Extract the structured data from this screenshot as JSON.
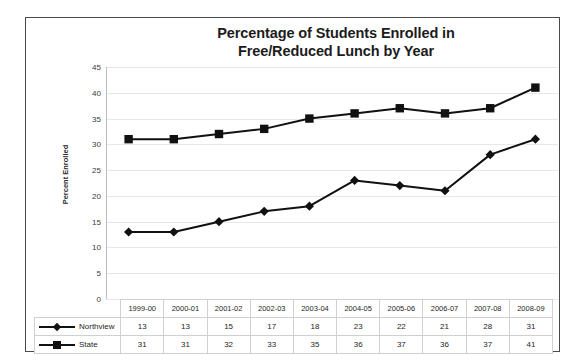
{
  "chart_data": {
    "type": "line",
    "title": "Percentage of Students Enrolled in Free/Reduced Lunch by Year",
    "title_lines": [
      "Percentage of Students Enrolled in",
      "Free/Reduced Lunch by Year"
    ],
    "xlabel": "",
    "ylabel": "Percent Enrolled",
    "ylim": [
      0,
      45
    ],
    "ytick_step": 5,
    "yticks": [
      45,
      40,
      35,
      30,
      25,
      20,
      15,
      10,
      5,
      0
    ],
    "categories": [
      "1999-00",
      "2000-01",
      "2001-02",
      "2002-03",
      "2003-04",
      "2004-05",
      "2005-06",
      "2006-07",
      "2007-08",
      "2008-09"
    ],
    "series": [
      {
        "name": "Northview",
        "marker": "diamond",
        "color": "#111111",
        "values": [
          13,
          13,
          15,
          17,
          18,
          23,
          22,
          21,
          28,
          31
        ]
      },
      {
        "name": "State",
        "marker": "square",
        "color": "#111111",
        "values": [
          31,
          31,
          32,
          33,
          35,
          36,
          37,
          36,
          37,
          41
        ]
      }
    ],
    "grid": true,
    "legend_position": "data-table-left",
    "has_data_table": true
  },
  "table": {
    "header": [
      "",
      "1999-00",
      "2000-01",
      "2001-02",
      "2002-03",
      "2003-04",
      "2004-05",
      "2005-06",
      "2006-07",
      "2007-08",
      "2008-09"
    ],
    "rows": [
      {
        "label": "Northview",
        "marker": "diamond",
        "cells": [
          "13",
          "13",
          "15",
          "17",
          "18",
          "23",
          "22",
          "21",
          "28",
          "31"
        ]
      },
      {
        "label": "State",
        "marker": "square",
        "cells": [
          "31",
          "31",
          "32",
          "33",
          "35",
          "36",
          "37",
          "36",
          "37",
          "41"
        ]
      }
    ]
  },
  "style": {
    "frame_color": "#4a4a4a",
    "gridline_color": "#e8e8e8",
    "series_color": "#111111",
    "text_color": "#262626",
    "background": "#ffffff"
  }
}
